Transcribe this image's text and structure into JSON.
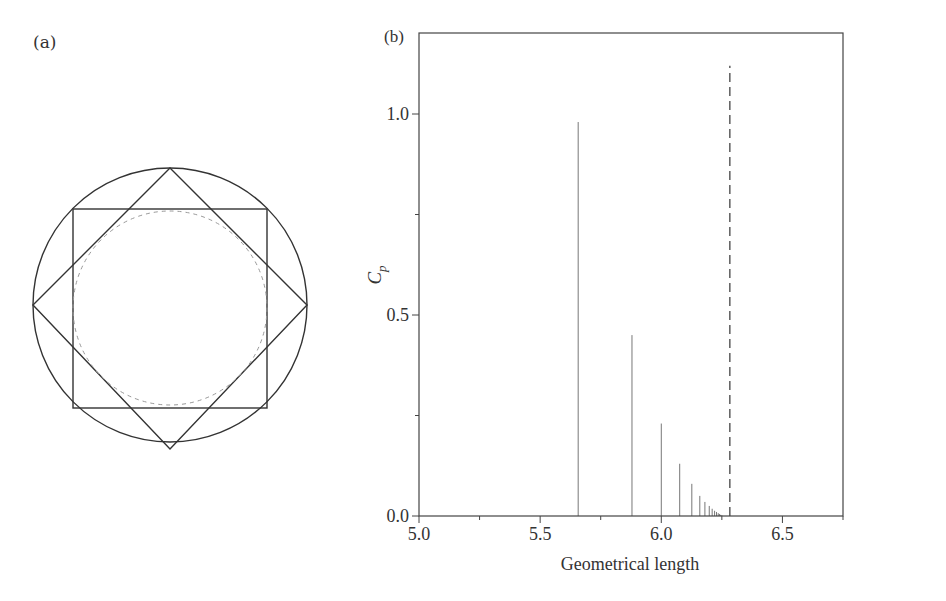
{
  "panel_a": {
    "label": "(a)",
    "description": "Circle with inscribed square and rotated square (octagram), dashed inner circle",
    "shapes": [
      "outer-circle",
      "axis-aligned-square",
      "rotated-square",
      "dashed-inner-circle"
    ]
  },
  "panel_b": {
    "label": "(b)",
    "xlabel": "Geometrical length",
    "ylabel_main": "C",
    "ylabel_sub": "p",
    "x_ticks": [
      "5.0",
      "5.5",
      "6.0",
      "6.5"
    ],
    "y_ticks": [
      "0.0",
      "0.5",
      "1.0"
    ]
  },
  "chart_data": [
    {
      "type": "diagram",
      "title": "(a)",
      "elements": [
        "circle",
        "square inscribed in circle",
        "square rotated 45° inscribed in circle",
        "dashed circle inscribed in square"
      ]
    },
    {
      "type": "bar",
      "title": "(b)",
      "xlabel": "Geometrical length",
      "ylabel": "C_p",
      "xlim": [
        5.0,
        6.75
      ],
      "ylim": [
        0.0,
        1.25
      ],
      "grid": false,
      "x": [
        5.657,
        5.879,
        6.0,
        6.076,
        6.126,
        6.159,
        6.18,
        6.198,
        6.21,
        6.22,
        6.228,
        6.235,
        6.24,
        6.245,
        6.25
      ],
      "values": [
        0.98,
        0.45,
        0.23,
        0.13,
        0.08,
        0.05,
        0.035,
        0.025,
        0.018,
        0.013,
        0.01,
        0.007,
        0.005,
        0.003,
        0.002
      ],
      "reference_line": {
        "x": 6.283,
        "style": "dashed",
        "top": 1.12,
        "label": "2π"
      }
    }
  ]
}
